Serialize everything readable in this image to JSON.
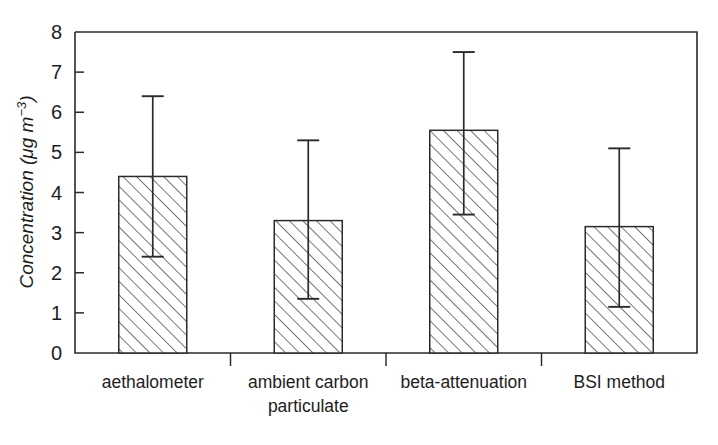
{
  "chart_data": {
    "type": "bar",
    "title": "",
    "xlabel": "",
    "ylabel": "Concentration (μg m⁻³)",
    "ylabel_base": "Concentration (μg m",
    "ylabel_exponent": "−3",
    "ylabel_close": ")",
    "categories": [
      "aethalometer",
      "ambient carbon particulate",
      "beta-attenuation",
      "BSI method"
    ],
    "category_lines": [
      [
        "aethalometer"
      ],
      [
        "ambient carbon",
        "particulate"
      ],
      [
        "beta-attenuation"
      ],
      [
        "BSI method"
      ]
    ],
    "values": [
      4.4,
      3.3,
      5.55,
      3.15
    ],
    "error_low": [
      2.4,
      1.35,
      3.45,
      1.15
    ],
    "error_high": [
      6.4,
      5.3,
      7.5,
      5.1
    ],
    "ylim": [
      0,
      8
    ],
    "yticks": [
      0,
      1,
      2,
      3,
      4,
      5,
      6,
      7,
      8
    ],
    "ytick_labels": [
      "0",
      "1",
      "2",
      "3",
      "4",
      "5",
      "6",
      "7",
      "8"
    ],
    "grid": false,
    "legend": null,
    "bar_fill": "#ffffff",
    "bar_edge": "#2b2b2b",
    "bar_hatch": "forward-diagonal",
    "axis_color": "#2b2b2b",
    "background": "#ffffff"
  }
}
